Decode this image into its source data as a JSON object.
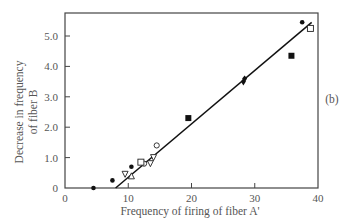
{
  "chart_data": {
    "type": "scatter",
    "title": "",
    "panel_label": "(b)",
    "xlabel": "Frequency of firing of fiber A'",
    "ylabel_line1": "Decrease in frequency",
    "ylabel_line2": "of fiber B",
    "xlim": [
      0,
      40
    ],
    "ylim": [
      0,
      5.7
    ],
    "xticks": [
      "0",
      "10",
      "20",
      "30",
      "40"
    ],
    "yticks": [
      "0",
      "1.0",
      "2.0",
      "3.0",
      "4.0",
      "5.0"
    ],
    "grid": false,
    "series": [
      {
        "name": "filled circles",
        "marker": "circle-filled",
        "points": [
          [
            4.5,
            0.0
          ],
          [
            7.5,
            0.25
          ],
          [
            10.5,
            0.7
          ],
          [
            37.5,
            5.45
          ]
        ]
      },
      {
        "name": "open circles",
        "marker": "circle-open",
        "points": [
          [
            12.5,
            0.8
          ],
          [
            14.5,
            1.4
          ]
        ]
      },
      {
        "name": "open squares",
        "marker": "square-open",
        "points": [
          [
            12,
            0.85
          ],
          [
            38.8,
            5.25
          ]
        ]
      },
      {
        "name": "filled squares",
        "marker": "square-filled",
        "points": [
          [
            19.5,
            2.3
          ],
          [
            35.8,
            4.35
          ]
        ]
      },
      {
        "name": "open triangles down",
        "marker": "triangle-down-open",
        "points": [
          [
            9.5,
            0.45
          ],
          [
            13.5,
            0.8
          ],
          [
            14,
            1.0
          ]
        ]
      },
      {
        "name": "open triangles up",
        "marker": "triangle-up-open",
        "points": [
          [
            10.5,
            0.4
          ]
        ]
      },
      {
        "name": "filled diamonds",
        "marker": "diamond-filled",
        "points": [
          [
            28.2,
            3.5
          ],
          [
            28.4,
            3.6
          ]
        ]
      }
    ],
    "fit_line": {
      "x0": 8.0,
      "y0": 0.0,
      "x1": 39.0,
      "y1": 5.45
    }
  }
}
